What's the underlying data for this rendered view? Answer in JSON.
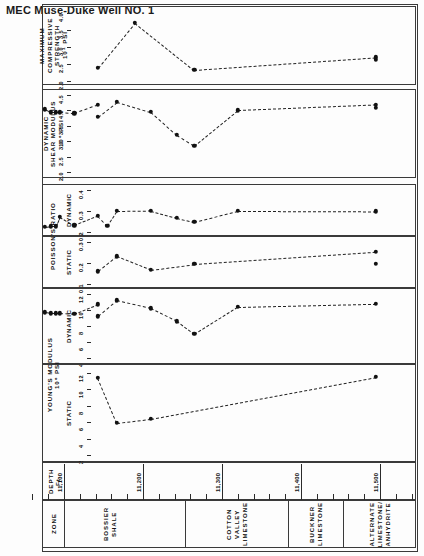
{
  "title": "MEC Muse-Duke Well NO. 1",
  "axes": {
    "depth_label": "DEPTH\nFt.",
    "zone_label": "ZONE"
  },
  "panels": [
    {
      "id": "max-compressive-strength",
      "name": "MAXIMUM\nCOMPRESSIVE\nSTRENGTH",
      "units": "10⁴ PSI",
      "sub": "",
      "ticks": [
        "2.0",
        "2.5",
        "3.0",
        "3.5",
        "4.0"
      ]
    },
    {
      "id": "dynamic-shear-modulus",
      "name": "DYNAMIC\nSHEAR MODULUS",
      "units": "10⁶ PSI",
      "sub": "",
      "ticks": [
        "2.0",
        "2.5",
        "3.0",
        "3.5",
        "4.0",
        "4.5"
      ]
    },
    {
      "id": "poissons-ratio-dynamic",
      "name": "POISSON'S RATIO",
      "units": "",
      "sub": "DYNAMIC",
      "ticks": [
        "0.2",
        "0.3",
        "0.4"
      ]
    },
    {
      "id": "poissons-ratio-static",
      "name": "",
      "units": "",
      "sub": "STATIC",
      "ticks": [
        "0.1",
        "0.2",
        "0.3"
      ]
    },
    {
      "id": "youngs-modulus-dynamic",
      "name": "YOUNG'S MODULUS",
      "units": "10⁶ PSI",
      "sub": "DYNAMIC",
      "ticks": [
        "4",
        "6",
        "8",
        "10",
        "12"
      ]
    },
    {
      "id": "youngs-modulus-static",
      "name": "",
      "units": "",
      "sub": "STATIC",
      "ticks": [
        "2",
        "4",
        "6",
        "8",
        "10",
        "12"
      ]
    }
  ],
  "depth": {
    "tick_labels": [
      "11,100",
      "11,200",
      "11,300",
      "11,400",
      "11,500"
    ],
    "tick_values": [
      11100,
      11200,
      11300,
      11400,
      11500
    ],
    "minor_step": 20,
    "range": [
      11050,
      11545
    ]
  },
  "zones": [
    {
      "label": "BOSSIER\nSHALE",
      "start": 11063,
      "end": 11255
    },
    {
      "label": "COTTON\nVALLEY\nLIMESTONE",
      "start": 11255,
      "end": 11385
    },
    {
      "label": "BUCKNER\nLIMESTONE",
      "start": 11385,
      "end": 11455
    },
    {
      "label": "ALTERNATE\nLIMESTONE/\nANHYDRITE",
      "start": 11455,
      "end": 11545
    }
  ],
  "chart_data": [
    {
      "type": "line",
      "title": "MAXIMUM COMPRESSIVE STRENGTH",
      "xlabel": "DEPTH Ft.",
      "ylabel": "MAXIMUM COMPRESSIVE STRENGTH 10⁴ PSI",
      "xlim": [
        11050,
        11545
      ],
      "ylim": [
        2.0,
        4.0
      ],
      "grid": false,
      "x": [
        11143,
        11190,
        11265,
        11495,
        11495
      ],
      "values": [
        2.39,
        3.72,
        2.33,
        2.7,
        2.62
      ]
    },
    {
      "type": "line",
      "title": "DYNAMIC SHEAR MODULUS",
      "xlabel": "DEPTH Ft.",
      "ylabel": "DYNAMIC SHEAR MODULUS 10⁶ PSI",
      "xlim": [
        11050,
        11545
      ],
      "ylim": [
        2.0,
        4.5
      ],
      "grid": false,
      "x": [
        11076,
        11083,
        11090,
        11095,
        11113,
        11143,
        11143,
        11167,
        11210,
        11243,
        11265,
        11320,
        11495,
        11495
      ],
      "values": [
        4.03,
        3.94,
        3.94,
        3.94,
        3.9,
        4.18,
        3.8,
        4.28,
        3.95,
        3.2,
        2.85,
        4.0,
        4.18,
        4.08
      ]
    },
    {
      "type": "line",
      "title": "POISSON'S RATIO - DYNAMIC",
      "xlabel": "DEPTH Ft.",
      "ylabel": "POISSON'S RATIO DYNAMIC",
      "xlim": [
        11050,
        11545
      ],
      "ylim": [
        0.2,
        0.4
      ],
      "grid": false,
      "x": [
        11076,
        11083,
        11090,
        11095,
        11113,
        11143,
        11155,
        11167,
        11210,
        11243,
        11265,
        11320,
        11495
      ],
      "values": [
        0.225,
        0.228,
        0.228,
        0.272,
        0.232,
        0.277,
        0.23,
        0.3,
        0.302,
        0.268,
        0.248,
        0.3,
        0.298
      ]
    },
    {
      "type": "line",
      "title": "POISSON'S RATIO - STATIC",
      "xlabel": "DEPTH Ft.",
      "ylabel": "POISSON'S RATIO STATIC",
      "xlim": [
        11050,
        11545
      ],
      "ylim": [
        0.1,
        0.3
      ],
      "grid": false,
      "x": [
        11143,
        11167,
        11210,
        11265,
        11495,
        11495
      ],
      "values": [
        0.16,
        0.232,
        0.168,
        0.195,
        0.253,
        0.196
      ]
    },
    {
      "type": "line",
      "title": "YOUNG'S MODULUS - DYNAMIC",
      "xlabel": "DEPTH Ft.",
      "ylabel": "YOUNG'S MODULUS DYNAMIC 10⁶ PSI",
      "xlim": [
        11050,
        11545
      ],
      "ylim": [
        4,
        12
      ],
      "grid": false,
      "x": [
        11076,
        11083,
        11090,
        11095,
        11113,
        11143,
        11143,
        11167,
        11210,
        11243,
        11265,
        11320,
        11495
      ],
      "values": [
        9.7,
        9.6,
        9.6,
        9.6,
        9.5,
        10.7,
        9.2,
        11.2,
        10.2,
        8.6,
        7.0,
        10.4,
        10.8
      ]
    },
    {
      "type": "line",
      "title": "YOUNG'S MODULUS - STATIC",
      "xlabel": "DEPTH Ft.",
      "ylabel": "YOUNG'S MODULUS STATIC 10⁶ PSI",
      "xlim": [
        11050,
        11545
      ],
      "ylim": [
        2,
        12
      ],
      "grid": false,
      "x": [
        11143,
        11167,
        11210,
        11495
      ],
      "values": [
        11.4,
        5.9,
        6.4,
        11.5
      ]
    }
  ]
}
